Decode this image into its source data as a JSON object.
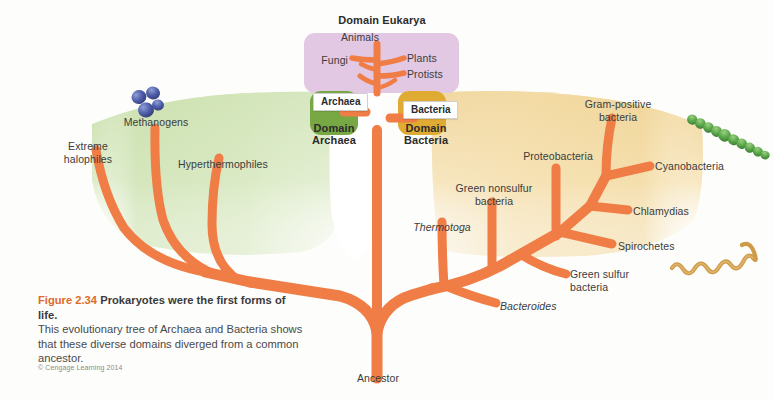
{
  "figure": {
    "number": "Figure 2.34",
    "headline": "Prokaryotes were the first forms of life.",
    "body_line1": "This evolutionary tree of Archaea and Bacteria shows",
    "body_line2": "that these diverse domains diverged from a common",
    "body_line3": "ancestor.",
    "copyright": "© Cengage Learning 2014"
  },
  "domains": {
    "eukarya": {
      "title": "Domain Eukarya",
      "box_color": "#e3c8e4",
      "members": [
        "Animals",
        "Fungi",
        "Plants",
        "Protists"
      ]
    },
    "archaea": {
      "chip": "Archaea",
      "title_line1": "Domain",
      "title_line2": "Archaea",
      "blob_color": "#7dae4c",
      "field_color": "#d5e6bb"
    },
    "bacteria": {
      "chip": "Bacteria",
      "title_line1": "Domain",
      "title_line2": "Bacteria",
      "blob_color": "#e2ae34",
      "field_color": "#f6e3b6"
    }
  },
  "root": {
    "label": "Ancestor"
  },
  "eukarya_branches": [
    {
      "name": "animals",
      "label": "Animals"
    },
    {
      "name": "fungi",
      "label": "Fungi"
    },
    {
      "name": "plants",
      "label": "Plants"
    },
    {
      "name": "protists",
      "label": "Protists"
    }
  ],
  "archaea_branches": [
    {
      "name": "extreme-halophiles",
      "label_line1": "Extreme",
      "label_line2": "halophiles"
    },
    {
      "name": "methanogens",
      "label_line1": "Methanogens",
      "label_line2": ""
    },
    {
      "name": "hyperthermophiles",
      "label_line1": "Hyperthermophiles",
      "label_line2": ""
    }
  ],
  "bacteria_branches": [
    {
      "name": "thermotoga",
      "label_line1": "Thermotoga",
      "label_line2": "",
      "italic": true
    },
    {
      "name": "bacteroides",
      "label_line1": "Bacteroides",
      "label_line2": "",
      "italic": true
    },
    {
      "name": "green-nonsulfur-bacteria",
      "label_line1": "Green nonsulfur",
      "label_line2": "bacteria",
      "italic": false
    },
    {
      "name": "green-sulfur-bacteria",
      "label_line1": "Green sulfur",
      "label_line2": "bacteria",
      "italic": false
    },
    {
      "name": "proteobacteria",
      "label_line1": "Proteobacteria",
      "label_line2": "",
      "italic": false
    },
    {
      "name": "gram-positive-bacteria",
      "label_line1": "Gram-positive",
      "label_line2": "bacteria",
      "italic": false
    },
    {
      "name": "cyanobacteria",
      "label_line1": "Cyanobacteria",
      "label_line2": "",
      "italic": false
    },
    {
      "name": "chlamydias",
      "label_line1": "Chlamydias",
      "label_line2": "",
      "italic": false
    },
    {
      "name": "spirochetes",
      "label_line1": "Spirochetes",
      "label_line2": "",
      "italic": false
    }
  ],
  "organisms": [
    {
      "name": "methanogen-cluster-illustration",
      "color": "#4b5aa8"
    },
    {
      "name": "cyanobacteria-filament-illustration",
      "color": "#5aa84b"
    },
    {
      "name": "spirochete-helix-illustration",
      "color": "#cf9b49"
    }
  ],
  "colors": {
    "branch": "#ef7d45",
    "text": "#3b3b3b",
    "accent": "#e06a2b",
    "page": "#fdfdfb"
  }
}
